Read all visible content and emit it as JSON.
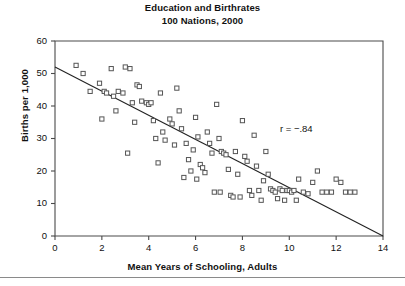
{
  "chart_data": {
    "type": "scatter",
    "title": "Education and Birthrates",
    "subtitle": "100 Nations, 2000",
    "xlabel": "Mean Years of Schooling, Adults",
    "ylabel": "Births per 1,000",
    "xlim": [
      0,
      14
    ],
    "ylim": [
      0,
      60
    ],
    "xticks": [
      0,
      2,
      4,
      6,
      8,
      10,
      12,
      14
    ],
    "yticks": [
      0,
      10,
      20,
      30,
      40,
      50,
      60
    ],
    "grid": false,
    "legend": null,
    "marker": "open-square",
    "marker_color": "#555555",
    "annotations": [
      {
        "text": "r = −.84",
        "x": 9.6,
        "y": 32.5
      }
    ],
    "trendline": {
      "type": "linear",
      "x0": 0,
      "y0": 52,
      "x1": 14,
      "y1": 0,
      "color": "#222222"
    },
    "points": [
      {
        "x": 0.9,
        "y": 52.5
      },
      {
        "x": 1.2,
        "y": 50.0
      },
      {
        "x": 1.5,
        "y": 44.5
      },
      {
        "x": 1.9,
        "y": 47.0
      },
      {
        "x": 2.1,
        "y": 44.5
      },
      {
        "x": 2.2,
        "y": 44.0
      },
      {
        "x": 2.4,
        "y": 51.5
      },
      {
        "x": 2.5,
        "y": 43.0
      },
      {
        "x": 2.6,
        "y": 38.5
      },
      {
        "x": 2.7,
        "y": 44.5
      },
      {
        "x": 2.9,
        "y": 44.0
      },
      {
        "x": 3.0,
        "y": 52.0
      },
      {
        "x": 3.2,
        "y": 51.5
      },
      {
        "x": 3.3,
        "y": 41.0
      },
      {
        "x": 3.5,
        "y": 46.5
      },
      {
        "x": 3.6,
        "y": 46.0
      },
      {
        "x": 3.7,
        "y": 41.5
      },
      {
        "x": 3.9,
        "y": 41.0
      },
      {
        "x": 4.0,
        "y": 40.5
      },
      {
        "x": 4.1,
        "y": 41.0
      },
      {
        "x": 4.2,
        "y": 35.5
      },
      {
        "x": 4.3,
        "y": 30.0
      },
      {
        "x": 4.5,
        "y": 44.0
      },
      {
        "x": 4.6,
        "y": 32.0
      },
      {
        "x": 4.7,
        "y": 29.5
      },
      {
        "x": 4.9,
        "y": 36.0
      },
      {
        "x": 5.0,
        "y": 34.5
      },
      {
        "x": 5.1,
        "y": 28.0
      },
      {
        "x": 5.2,
        "y": 45.5
      },
      {
        "x": 5.3,
        "y": 38.5
      },
      {
        "x": 5.4,
        "y": 33.0
      },
      {
        "x": 5.6,
        "y": 28.5
      },
      {
        "x": 5.7,
        "y": 23.5
      },
      {
        "x": 5.8,
        "y": 20.0
      },
      {
        "x": 5.9,
        "y": 26.5
      },
      {
        "x": 6.0,
        "y": 36.5
      },
      {
        "x": 6.1,
        "y": 30.5
      },
      {
        "x": 6.2,
        "y": 22.0
      },
      {
        "x": 6.3,
        "y": 21.0
      },
      {
        "x": 6.4,
        "y": 19.5
      },
      {
        "x": 6.5,
        "y": 32.0
      },
      {
        "x": 6.6,
        "y": 28.5
      },
      {
        "x": 6.7,
        "y": 25.5
      },
      {
        "x": 6.8,
        "y": 13.5
      },
      {
        "x": 6.9,
        "y": 40.5
      },
      {
        "x": 7.0,
        "y": 30.0
      },
      {
        "x": 7.1,
        "y": 26.0
      },
      {
        "x": 7.2,
        "y": 25.5
      },
      {
        "x": 7.3,
        "y": 25.0
      },
      {
        "x": 7.4,
        "y": 20.5
      },
      {
        "x": 7.5,
        "y": 12.5
      },
      {
        "x": 7.6,
        "y": 12.0
      },
      {
        "x": 7.7,
        "y": 26.0
      },
      {
        "x": 7.8,
        "y": 19.0
      },
      {
        "x": 7.9,
        "y": 12.0
      },
      {
        "x": 8.0,
        "y": 35.5
      },
      {
        "x": 8.1,
        "y": 24.5
      },
      {
        "x": 8.2,
        "y": 23.0
      },
      {
        "x": 8.3,
        "y": 14.0
      },
      {
        "x": 8.4,
        "y": 12.5
      },
      {
        "x": 8.5,
        "y": 31.0
      },
      {
        "x": 8.6,
        "y": 21.5
      },
      {
        "x": 8.7,
        "y": 14.0
      },
      {
        "x": 8.8,
        "y": 11.0
      },
      {
        "x": 9.0,
        "y": 26.0
      },
      {
        "x": 9.1,
        "y": 19.0
      },
      {
        "x": 9.2,
        "y": 14.5
      },
      {
        "x": 9.3,
        "y": 14.0
      },
      {
        "x": 9.4,
        "y": 13.5
      },
      {
        "x": 9.5,
        "y": 11.5
      },
      {
        "x": 9.6,
        "y": 14.5
      },
      {
        "x": 9.7,
        "y": 14.0
      },
      {
        "x": 9.8,
        "y": 11.0
      },
      {
        "x": 9.9,
        "y": 14.0
      },
      {
        "x": 10.0,
        "y": 14.0
      },
      {
        "x": 10.1,
        "y": 13.5
      },
      {
        "x": 10.2,
        "y": 14.0
      },
      {
        "x": 10.3,
        "y": 11.0
      },
      {
        "x": 10.4,
        "y": 17.5
      },
      {
        "x": 10.6,
        "y": 13.5
      },
      {
        "x": 10.8,
        "y": 13.0
      },
      {
        "x": 11.0,
        "y": 16.5
      },
      {
        "x": 11.2,
        "y": 20.0
      },
      {
        "x": 11.4,
        "y": 13.5
      },
      {
        "x": 11.6,
        "y": 13.5
      },
      {
        "x": 11.8,
        "y": 13.5
      },
      {
        "x": 12.0,
        "y": 17.5
      },
      {
        "x": 12.2,
        "y": 16.5
      },
      {
        "x": 12.4,
        "y": 13.5
      },
      {
        "x": 12.6,
        "y": 13.5
      },
      {
        "x": 12.8,
        "y": 13.5
      },
      {
        "x": 3.4,
        "y": 35.0
      },
      {
        "x": 4.4,
        "y": 22.5
      },
      {
        "x": 5.5,
        "y": 18.0
      },
      {
        "x": 2.0,
        "y": 36.0
      },
      {
        "x": 3.1,
        "y": 25.5
      },
      {
        "x": 6.05,
        "y": 17.5
      },
      {
        "x": 7.05,
        "y": 13.5
      },
      {
        "x": 8.9,
        "y": 17.0
      }
    ]
  }
}
